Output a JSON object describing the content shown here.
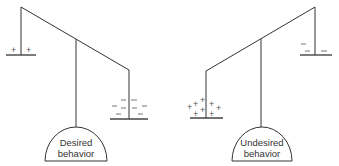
{
  "diagram": {
    "type": "balance-scales",
    "scales": [
      {
        "id": "left",
        "dome_label_line1": "Desired",
        "dome_label_line2": "behavior",
        "heavy_side": "right",
        "left_pan_signs": [
          "+",
          "+"
        ],
        "right_pan_signs": [
          "−",
          "−",
          "−",
          "−",
          "−",
          "−",
          "−",
          "−"
        ]
      },
      {
        "id": "right",
        "dome_label_line1": "Undesired",
        "dome_label_line2": "behavior",
        "heavy_side": "left",
        "left_pan_signs": [
          "+",
          "+",
          "+",
          "+",
          "+",
          "+",
          "+",
          "+"
        ],
        "right_pan_signs": [
          "−",
          "−",
          "−"
        ]
      }
    ],
    "colors": {
      "line": "#333333",
      "background": "#ffffff"
    }
  }
}
